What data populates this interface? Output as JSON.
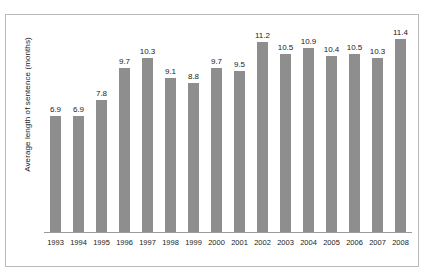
{
  "chart_data": {
    "type": "bar",
    "title": "",
    "subtitle": "",
    "xlabel": "",
    "ylabel": "Average length of sentence (months)",
    "categories": [
      "1993",
      "1994",
      "1995",
      "1996",
      "1997",
      "1998",
      "1999",
      "2000",
      "2001",
      "2002",
      "2003",
      "2004",
      "2005",
      "2006",
      "2007",
      "2008"
    ],
    "values": [
      6.9,
      6.9,
      7.8,
      9.7,
      10.3,
      9.1,
      8.8,
      9.7,
      9.5,
      11.2,
      10.5,
      10.9,
      10.4,
      10.5,
      10.3,
      11.4
    ],
    "value_labels": [
      "6.9",
      "6.9",
      "7.8",
      "9.7",
      "10.3",
      "9.1",
      "8.8",
      "9.7",
      "9.5",
      "11.2",
      "10.5",
      "10.9",
      "10.4",
      "10.5",
      "10.3",
      "11.4"
    ],
    "ylim": [
      0,
      12.4
    ],
    "grid": false,
    "legend": null,
    "legend_position": "none",
    "bar_color": "#8e8e8e",
    "axis_color": "#9a9a9a",
    "frame_color": "#b9b9b9",
    "text_color": "#1a1a1a",
    "background": "#ffffff",
    "y_axis_ticks_shown": false,
    "data_labels_shown": true
  }
}
